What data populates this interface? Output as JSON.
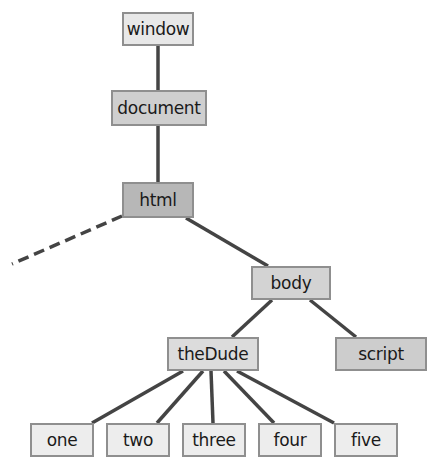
{
  "diagram": {
    "type": "tree",
    "title": "",
    "nodes": {
      "window": "window",
      "document": "document",
      "html": "html",
      "body": "body",
      "thedude": "theDude",
      "script": "script",
      "one": "one",
      "two": "two",
      "three": "three",
      "four": "four",
      "five": "five"
    },
    "edges": [
      {
        "from": "window",
        "to": "document",
        "style": "solid"
      },
      {
        "from": "document",
        "to": "html",
        "style": "solid"
      },
      {
        "from": "html",
        "to": "(offscreen)",
        "style": "dashed"
      },
      {
        "from": "html",
        "to": "body",
        "style": "solid"
      },
      {
        "from": "body",
        "to": "theDude",
        "style": "solid"
      },
      {
        "from": "body",
        "to": "script",
        "style": "solid"
      },
      {
        "from": "theDude",
        "to": "one",
        "style": "solid"
      },
      {
        "from": "theDude",
        "to": "two",
        "style": "solid"
      },
      {
        "from": "theDude",
        "to": "three",
        "style": "solid"
      },
      {
        "from": "theDude",
        "to": "four",
        "style": "solid"
      },
      {
        "from": "theDude",
        "to": "five",
        "style": "solid"
      }
    ],
    "colors": {
      "edge": "#444444",
      "border": "#8f8f8f",
      "window_fill": "#e8e8e8",
      "document_fill": "#cfcfcf",
      "html_fill": "#b7b7b7",
      "body_fill": "#d3d3d3",
      "thedude_fill": "#dcdcdc",
      "script_fill": "#cdcdcd",
      "leaf_fill": "#ededed"
    }
  }
}
